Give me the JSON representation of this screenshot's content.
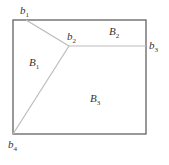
{
  "diagram": {
    "frame": {
      "x1": 13,
      "y1": 20,
      "x2": 146,
      "y2": 134,
      "color": "#555555"
    },
    "edges_color": "#bbbbbb",
    "points": {
      "b1": {
        "label": "b",
        "sub": "1",
        "x": 26,
        "y": 20
      },
      "b2": {
        "label": "b",
        "sub": "2",
        "x": 69,
        "y": 46
      },
      "b3": {
        "label": "b",
        "sub": "3",
        "x": 146,
        "y": 46
      },
      "b4": {
        "label": "b",
        "sub": "4",
        "x": 13,
        "y": 134
      }
    },
    "regions": {
      "B1": {
        "label": "B",
        "sub": "1"
      },
      "B2": {
        "label": "B",
        "sub": "2"
      },
      "B3": {
        "label": "B",
        "sub": "3"
      }
    }
  }
}
